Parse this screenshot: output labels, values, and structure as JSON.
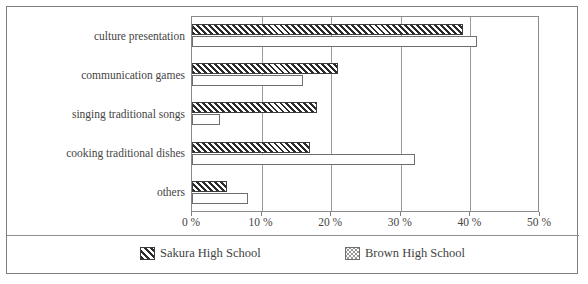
{
  "chart_data": {
    "type": "bar",
    "orientation": "horizontal",
    "title": "",
    "xlabel": "",
    "ylabel": "",
    "xlim": [
      0,
      50
    ],
    "xticks": [
      0,
      10,
      20,
      30,
      40,
      50
    ],
    "xtick_labels": [
      "0 %",
      "10 %",
      "20 %",
      "30 %",
      "40 %",
      "50 %"
    ],
    "grid": true,
    "legend_position": "bottom",
    "categories": [
      "culture presentation",
      "communication games",
      "singing traditional songs",
      "cooking traditional dishes",
      "others"
    ],
    "series": [
      {
        "name": "Sakura High School",
        "pattern": "diagonal-hatch",
        "values": [
          39,
          21,
          18,
          17,
          5
        ]
      },
      {
        "name": "Brown High School",
        "pattern": "dotted",
        "values": [
          41,
          16,
          4,
          32,
          8
        ]
      }
    ]
  },
  "legend": {
    "items": [
      {
        "label": "Sakura High School",
        "swatch": "diagonal-hatch-swatch"
      },
      {
        "label": "Brown High School",
        "swatch": "dotted-swatch"
      }
    ]
  }
}
